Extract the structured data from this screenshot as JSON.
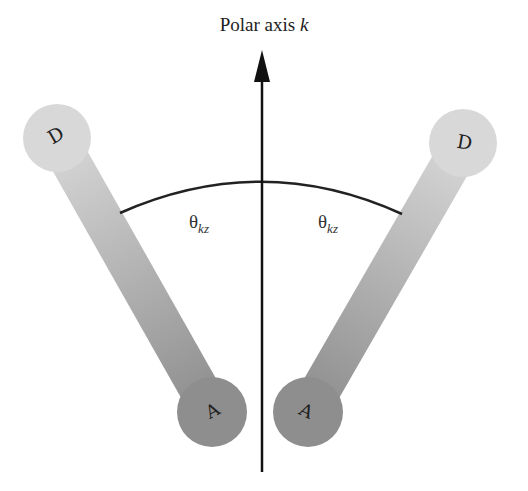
{
  "title": {
    "text": "Polar axis ",
    "variable": "k"
  },
  "angle_labels": [
    {
      "symbol": "θ",
      "subscript": "kz"
    },
    {
      "symbol": "θ",
      "subscript": "kz"
    }
  ],
  "molecules": [
    {
      "donor_label": "D",
      "acceptor_label": "A",
      "side": "left"
    },
    {
      "donor_label": "D",
      "acceptor_label": "A",
      "side": "right"
    }
  ],
  "colors": {
    "donor": "#d6d6d6",
    "acceptor": "#8e8e8e",
    "axis": "#111111"
  }
}
